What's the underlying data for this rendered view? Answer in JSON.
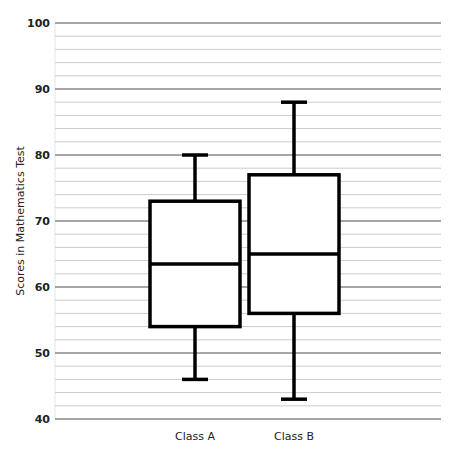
{
  "chart_data": {
    "type": "boxplot",
    "title": "",
    "xlabel": "",
    "ylabel": "Scores in Mathematics Test",
    "ylim": [
      40,
      100
    ],
    "yticks": [
      40,
      50,
      60,
      70,
      80,
      90,
      100
    ],
    "minor_step": 2,
    "grid": true,
    "categories": [
      "Class A",
      "Class B"
    ],
    "series": [
      {
        "name": "Class A",
        "min": 46,
        "q1": 54,
        "median": 63.5,
        "q3": 73,
        "max": 80
      },
      {
        "name": "Class B",
        "min": 43,
        "q1": 56,
        "median": 65,
        "q3": 77,
        "max": 88
      }
    ],
    "colors": {
      "box_stroke": "#000000",
      "box_fill": "#ffffff",
      "major_grid": "#888888",
      "minor_grid": "#cccccc"
    }
  }
}
